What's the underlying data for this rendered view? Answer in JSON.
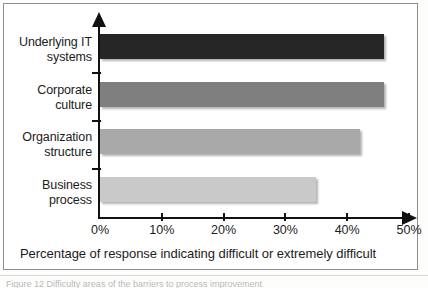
{
  "figure": {
    "axis_caption": "Percentage of response indicating difficult or extremely difficult",
    "page_caption": "Figure 12  Difficulty areas of the barriers to process improvement",
    "colors": {
      "bar_1": "#262626",
      "bar_2": "#7f7f7f",
      "bar_3": "#a9a9a9",
      "bar_4": "#c9c9c9",
      "axis": "#111111",
      "text": "#1b1b1b"
    }
  },
  "chart_data": {
    "type": "bar",
    "orientation": "horizontal",
    "title": "",
    "subtitle": "",
    "xlabel": "Percentage of response indicating difficult or extremely difficult",
    "ylabel": "",
    "categories": [
      "Underlying IT systems",
      "Corporate culture",
      "Organization structure",
      "Business process"
    ],
    "category_lines": [
      [
        "Underlying IT",
        "systems"
      ],
      [
        "Corporate",
        "culture"
      ],
      [
        "Organization",
        "structure"
      ],
      [
        "Business",
        "process"
      ]
    ],
    "values": [
      46,
      46,
      42,
      35
    ],
    "value_labels": [
      "46%",
      "46%",
      "42%",
      "35%"
    ],
    "series": [
      {
        "name": "Percentage of response indicating difficult or extremely difficult",
        "values": [
          46,
          46,
          42,
          35
        ]
      }
    ],
    "bar_colors": [
      "#262626",
      "#7f7f7f",
      "#a9a9a9",
      "#c9c9c9"
    ],
    "xlim": [
      0,
      50
    ],
    "xticks": [
      0,
      10,
      20,
      30,
      40,
      50
    ],
    "xtick_labels": [
      "0%",
      "10%",
      "20%",
      "30%",
      "40%",
      "50%"
    ],
    "grid": false,
    "legend": false,
    "legend_position": "none"
  }
}
